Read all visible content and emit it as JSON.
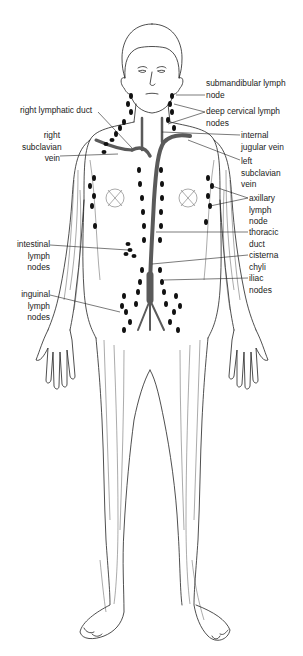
{
  "diagram": {
    "colors": {
      "background": "#ffffff",
      "outline": "#222222",
      "vessel": "#555555",
      "node": "#111111",
      "label": "#1a1a1a"
    },
    "labels": {
      "left": [
        {
          "id": "right-lymphatic-duct",
          "lines": [
            "right lymphatic duct"
          ]
        },
        {
          "id": "right-subclavian-vein",
          "lines": [
            "right",
            "subclavian",
            "vein"
          ]
        },
        {
          "id": "intestinal-lymph-nodes",
          "lines": [
            "intestinal",
            "lymph",
            "nodes"
          ]
        },
        {
          "id": "inguinal-lymph-nodes",
          "lines": [
            "inguinal",
            "lymph",
            "nodes"
          ]
        }
      ],
      "right": [
        {
          "id": "submandibular-lymph-node",
          "lines": [
            "submandibular lymph",
            "node"
          ]
        },
        {
          "id": "deep-cervical-lymph-nodes",
          "lines": [
            "deep cervical lymph",
            "nodes"
          ]
        },
        {
          "id": "internal-jugular-vein",
          "lines": [
            "internal",
            "jugular vein"
          ]
        },
        {
          "id": "left-subclavian-vein",
          "lines": [
            "left",
            "subclavian",
            "vein"
          ]
        },
        {
          "id": "axillary-lymph-node",
          "lines": [
            "axillary",
            "lymph",
            "node"
          ]
        },
        {
          "id": "thoracic-duct",
          "lines": [
            "thoracic",
            "duct"
          ]
        },
        {
          "id": "cisterna-chyli",
          "lines": [
            "cisterna",
            "chyli"
          ]
        },
        {
          "id": "iliac-nodes",
          "lines": [
            "iliac",
            "nodes"
          ]
        }
      ]
    }
  }
}
